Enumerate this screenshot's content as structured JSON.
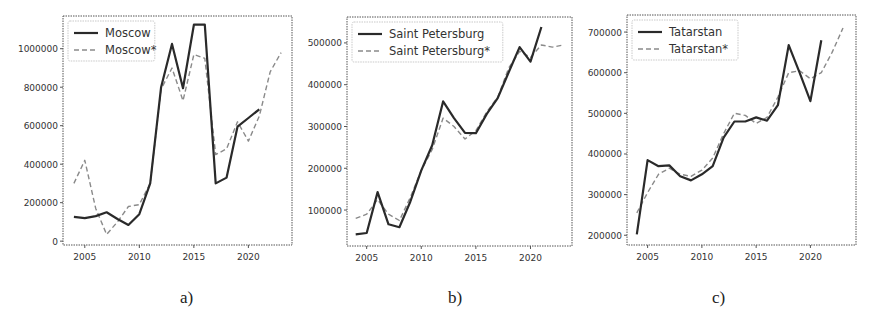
{
  "chart_data": [
    {
      "type": "line",
      "panel_label": "a)",
      "title": "",
      "xlabel": "",
      "ylabel": "",
      "x": [
        2004,
        2005,
        2006,
        2007,
        2008,
        2009,
        2010,
        2011,
        2012,
        2013,
        2014,
        2015,
        2016,
        2017,
        2018,
        2019,
        2020,
        2021,
        2022,
        2023
      ],
      "xticks": [
        2005,
        2010,
        2015,
        2020
      ],
      "yticks": [
        0,
        200000,
        400000,
        600000,
        800000,
        1000000
      ],
      "ytick_labels": [
        "0",
        "200000",
        "400000",
        "600000",
        "800000",
        "1000000"
      ],
      "xlim": [
        2003,
        2024
      ],
      "ylim": [
        -20000,
        1170000
      ],
      "grid": false,
      "legend_position": "upper left",
      "series": [
        {
          "name": "Moscow",
          "style": "solid",
          "values": [
            126000,
            120000,
            130000,
            150000,
            115000,
            84000,
            140000,
            300000,
            800000,
            1025000,
            795000,
            1125000,
            1125000,
            300000,
            330000,
            595000,
            640000,
            685000,
            null,
            null
          ]
        },
        {
          "name": "Moscow*",
          "style": "dashed",
          "values": [
            300000,
            420000,
            170000,
            35000,
            100000,
            180000,
            190000,
            300000,
            790000,
            900000,
            730000,
            970000,
            950000,
            450000,
            480000,
            620000,
            520000,
            650000,
            880000,
            980000
          ]
        }
      ]
    },
    {
      "type": "line",
      "panel_label": "b)",
      "title": "",
      "xlabel": "",
      "ylabel": "",
      "x": [
        2004,
        2005,
        2006,
        2007,
        2008,
        2009,
        2010,
        2011,
        2012,
        2013,
        2014,
        2015,
        2016,
        2017,
        2018,
        2019,
        2020,
        2021,
        2022,
        2023
      ],
      "xticks": [
        2005,
        2010,
        2015,
        2020
      ],
      "yticks": [
        100000,
        200000,
        300000,
        400000,
        500000
      ],
      "ytick_labels": [
        "100000",
        "200000",
        "300000",
        "400000",
        "500000"
      ],
      "xlim": [
        2003.2,
        2023.8
      ],
      "ylim": [
        14000,
        562000
      ],
      "grid": false,
      "legend_position": "upper left",
      "series": [
        {
          "name": "Saint Petersburg",
          "style": "solid",
          "values": [
            42000,
            45000,
            143000,
            66000,
            59000,
            120000,
            195000,
            255000,
            360000,
            320000,
            285000,
            284000,
            330000,
            368000,
            430000,
            490000,
            455000,
            538000,
            null,
            null
          ]
        },
        {
          "name": "Saint Petersburg*",
          "style": "dashed",
          "values": [
            80000,
            90000,
            125000,
            90000,
            75000,
            130000,
            195000,
            245000,
            320000,
            300000,
            270000,
            290000,
            335000,
            370000,
            440000,
            480000,
            465000,
            495000,
            490000,
            495000
          ]
        }
      ]
    },
    {
      "type": "line",
      "panel_label": "c)",
      "title": "",
      "xlabel": "",
      "ylabel": "",
      "x": [
        2004,
        2005,
        2006,
        2007,
        2008,
        2009,
        2010,
        2011,
        2012,
        2013,
        2014,
        2015,
        2016,
        2017,
        2018,
        2019,
        2020,
        2021,
        2022,
        2023
      ],
      "xticks": [
        2005,
        2010,
        2015,
        2020
      ],
      "yticks": [
        200000,
        300000,
        400000,
        500000,
        600000,
        700000
      ],
      "ytick_labels": [
        "200000",
        "300000",
        "400000",
        "500000",
        "600000",
        "700000"
      ],
      "xlim": [
        2003.1,
        2024.2
      ],
      "ylim": [
        176000,
        742000
      ],
      "grid": false,
      "legend_position": "upper left",
      "series": [
        {
          "name": "Tatarstan",
          "style": "solid",
          "values": [
            202000,
            385000,
            370000,
            372000,
            345000,
            335000,
            350000,
            370000,
            440000,
            480000,
            480000,
            490000,
            482000,
            520000,
            668000,
            600000,
            530000,
            680000,
            null,
            null
          ]
        },
        {
          "name": "Tatarstan*",
          "style": "dashed",
          "values": [
            255000,
            305000,
            350000,
            365000,
            350000,
            345000,
            360000,
            390000,
            450000,
            500000,
            495000,
            475000,
            490000,
            540000,
            600000,
            605000,
            585000,
            600000,
            650000,
            710000
          ]
        }
      ]
    }
  ],
  "panels": [
    {
      "caption": "a)",
      "frame": {
        "left": 63,
        "top": 16,
        "right": 292,
        "bottom": 245
      }
    },
    {
      "caption": "b)",
      "frame": {
        "left": 347,
        "top": 17,
        "right": 572,
        "bottom": 246
      }
    },
    {
      "caption": "c)",
      "frame": {
        "left": 627,
        "top": 15,
        "right": 856,
        "bottom": 245
      }
    }
  ],
  "colors": {
    "solid_line": "#2a2a2a",
    "dashed_line": "#8a8a8a",
    "frame": "#555555",
    "text": "#333333"
  }
}
